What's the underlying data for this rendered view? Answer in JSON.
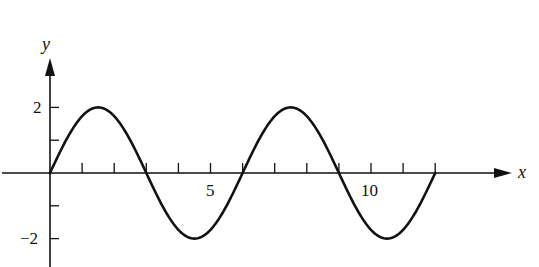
{
  "chart_data": {
    "type": "line",
    "title": "",
    "xlabel": "x",
    "ylabel": "y",
    "function": "y = 2 sin(pi x / 3)",
    "xlim": [
      0,
      12
    ],
    "ylim": [
      -2,
      2
    ],
    "grid": false,
    "legend": null,
    "x_ticks": [
      1,
      2,
      3,
      4,
      5,
      6,
      7,
      8,
      9,
      10,
      11,
      12
    ],
    "x_tick_labels": {
      "5": "5",
      "10": "10"
    },
    "y_ticks": [
      -2,
      -1,
      1,
      2
    ],
    "y_tick_labels": {
      "2": "2",
      "-2": "−2"
    },
    "series": [
      {
        "name": "curve",
        "x": [
          0,
          1.5,
          3,
          4.5,
          6,
          7.5,
          9,
          10.5,
          12
        ],
        "y": [
          0,
          2,
          0,
          -2,
          0,
          2,
          0,
          -2,
          0
        ]
      }
    ]
  },
  "labels": {
    "x_axis": "x",
    "y_axis": "y",
    "x_tick_5": "5",
    "x_tick_10": "10",
    "y_tick_2": "2",
    "y_tick_neg2": "−2"
  },
  "colors": {
    "ink": "#111111",
    "background": "#ffffff"
  }
}
